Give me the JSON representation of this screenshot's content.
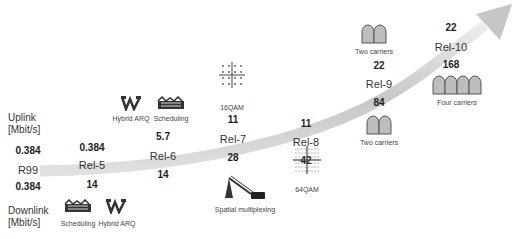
{
  "axis_labels": {
    "uplink": "Uplink",
    "uplink_unit": "[Mbit/s]",
    "downlink": "Downlink",
    "downlink_unit": "[Mbit/s]"
  },
  "releases": [
    {
      "name": "R99",
      "uplink": "0.384",
      "downlink": "0.384"
    },
    {
      "name": "Rel-5",
      "uplink": "0.384",
      "downlink": "14"
    },
    {
      "name": "Rel-6",
      "uplink": "5.7",
      "downlink": "14"
    },
    {
      "name": "Rel-7",
      "uplink": "11",
      "downlink": "28"
    },
    {
      "name": "Rel-8",
      "uplink": "11",
      "downlink": "42"
    },
    {
      "name": "Rel-9",
      "uplink": "22",
      "downlink": "84"
    },
    {
      "name": "Rel-10",
      "uplink": "22",
      "downlink": "168"
    }
  ],
  "features": {
    "rel5_scheduling": "Scheduling",
    "rel5_harq": "Hybrid ARQ",
    "rel6_harq": "Hybrid ARQ",
    "rel6_scheduling": "Scheduling",
    "rel7_16qam": "16QAM",
    "rel7_mimo": "Spatial multiplexing",
    "rel8_64qam": "64QAM",
    "rel9_ul_carriers": "Two carriers",
    "rel9_dl_carriers": "Two carriers",
    "rel10_carriers": "Four carriers"
  },
  "colors": {
    "ribbon": "#c8c8c8",
    "ribbon_dark": "#a8a8a8",
    "carrier_fill": "#bdbdbd",
    "carrier_stroke": "#555555"
  }
}
